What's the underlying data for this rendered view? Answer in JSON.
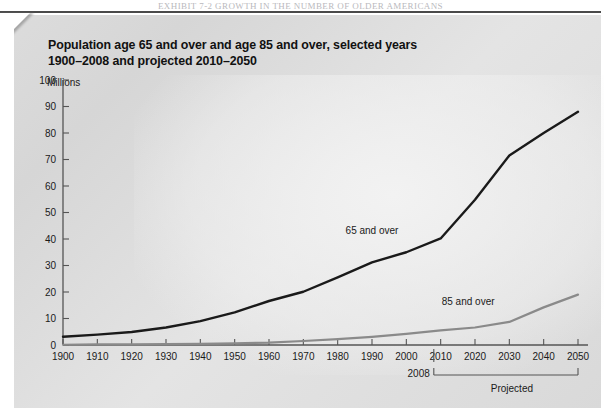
{
  "running_head": "EXHIBIT 7-2    GROWTH IN THE NUMBER OF OLDER AMERICANS",
  "title": {
    "line1": "Population age 65 and over and age 85 and over, selected years",
    "line2": "1900–2008 and projected 2010–2050"
  },
  "unit_label": "Millions",
  "colors": {
    "series_65": "#1a1a1a",
    "series_85": "#8a8a8a",
    "axis": "#555555",
    "panel": "#dcdcdc",
    "text": "#1a1a1a"
  },
  "annotations": {
    "marker_2008": "2008",
    "projected": "Projected"
  },
  "chart_data": {
    "type": "line",
    "title": "Population age 65 and over and age 85 and over, selected years 1900–2008 and projected 2010–2050",
    "xlabel": "",
    "ylabel": "Millions",
    "ylim": [
      0,
      100
    ],
    "xlim": [
      1900,
      2050
    ],
    "yticks": [
      0,
      10,
      20,
      30,
      40,
      50,
      60,
      70,
      80,
      90,
      100
    ],
    "ytick_labels": [
      "0",
      "10",
      "20",
      "30",
      "40",
      "50",
      "60",
      "70",
      "80",
      "90",
      "100"
    ],
    "x": [
      1900,
      1910,
      1920,
      1930,
      1940,
      1950,
      1960,
      1970,
      1980,
      1990,
      2000,
      2010,
      2020,
      2030,
      2040,
      2050
    ],
    "xtick_labels": [
      "1900",
      "1910",
      "1920",
      "1930",
      "1940",
      "1950",
      "1960",
      "1970",
      "1980",
      "1990",
      "2000",
      "2010",
      "2020",
      "2030",
      "2040",
      "2050"
    ],
    "grid": false,
    "legend": "inline-labels",
    "series": [
      {
        "name": "65 and over",
        "color": "#1a1a1a",
        "label_x": 1990,
        "label_y": 42,
        "values": [
          3.1,
          3.9,
          4.9,
          6.6,
          9.0,
          12.3,
          16.6,
          20.1,
          25.5,
          31.2,
          35.0,
          40.2,
          54.8,
          71.5,
          80.0,
          88.0
        ]
      },
      {
        "name": "85 and over",
        "color": "#8a8a8a",
        "label_x": 2018,
        "label_y": 15,
        "values": [
          0.1,
          0.2,
          0.2,
          0.3,
          0.4,
          0.6,
          0.9,
          1.5,
          2.2,
          3.1,
          4.2,
          5.5,
          6.6,
          8.7,
          14.2,
          19.0
        ]
      }
    ],
    "annotations": [
      {
        "text": "2008",
        "x": 2008,
        "type": "tick-marker"
      },
      {
        "text": "Projected",
        "x_start": 2008,
        "x_end": 2050,
        "type": "bracket"
      }
    ]
  }
}
